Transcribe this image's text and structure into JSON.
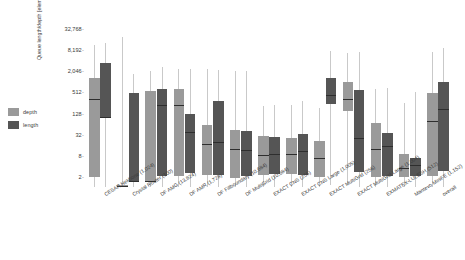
{
  "legend": {
    "items": [
      {
        "label": "depth",
        "color": "#9a9a9a",
        "name": "depth"
      },
      {
        "label": "length",
        "color": "#555555",
        "name": "length"
      }
    ]
  },
  "axes": {
    "ylabel": "Queue length/depth [elements]",
    "yticks": [
      "32,768",
      "8,192",
      "2,046",
      "512",
      "128",
      "32",
      "8",
      "2"
    ],
    "ytick_values": [
      32768,
      8192,
      2046,
      512,
      128,
      32,
      8,
      2
    ],
    "ylim": [
      1,
      65536
    ],
    "yscale": "log4",
    "grid": false
  },
  "colors": {
    "depth": "#9a9a9a",
    "length": "#555555",
    "whisker": "#c9c9c9",
    "median": "#2e2e2e",
    "text": "#3a3a3a",
    "background": "#ffffff"
  },
  "chart_data": {
    "type": "bar",
    "subtype": "box-plot",
    "title": "",
    "xlabel": "",
    "ylabel": "Queue length/depth [elements]",
    "ylim": [
      1,
      65536
    ],
    "yscale": "log4",
    "grid": false,
    "legend_position": "left",
    "categories": [
      "CESAR Nekbone (1,024)",
      "Crystal Router (100)",
      "DF AMG (13,824)",
      "DF AMR (1,728)",
      "DF Fillboundary (10,684)",
      "DF MultiGrid (10,684)",
      "EXACT CNS (256)",
      "EXACT CNS Large (1,005)",
      "EXACT MultiGrid (256)",
      "EXACT MultiGrid Large (1,004)",
      "EXMATEX-LULESH (512)",
      "Mantevo MiniFE (1,152)",
      "overall"
    ],
    "series": [
      {
        "name": "depth",
        "color": "#9a9a9a",
        "boxes": [
          {
            "whisker_low": 1.1,
            "q1": 2.1,
            "median": 330,
            "q3": 1350,
            "whisker_high": 11000
          },
          {
            "whisker_low": 1.1,
            "q1": 1.15,
            "median": 1.15,
            "q3": 1.2,
            "whisker_high": 19000
          },
          {
            "whisker_low": 1.1,
            "q1": 1.6,
            "median": 1.6,
            "q3": 560,
            "whisker_high": 2100
          },
          {
            "whisker_low": 1.1,
            "q1": 2.2,
            "median": 230,
            "q3": 620,
            "whisker_high": 2400
          },
          {
            "whisker_low": 1.1,
            "q1": 2.3,
            "median": 18,
            "q3": 62,
            "whisker_high": 2300
          },
          {
            "whisker_low": 1.1,
            "q1": 1.9,
            "median": 13,
            "q3": 45,
            "whisker_high": 2100
          },
          {
            "whisker_low": 1.1,
            "q1": 2.4,
            "median": 8.5,
            "q3": 30,
            "whisker_high": 210
          },
          {
            "whisker_low": 1.1,
            "q1": 2.5,
            "median": 9,
            "q3": 26,
            "whisker_high": 220
          },
          {
            "whisker_low": 1.1,
            "q1": 2.0,
            "median": 7,
            "q3": 22,
            "whisker_high": 190
          },
          {
            "whisker_low": 1.3,
            "q1": 150,
            "median": 330,
            "q3": 1000,
            "whisker_high": 6800
          },
          {
            "whisker_low": 1.1,
            "q1": 2.0,
            "median": 13,
            "q3": 70,
            "whisker_high": 640
          },
          {
            "whisker_low": 1.1,
            "q1": 2.0,
            "median": 3.6,
            "q3": 9,
            "whisker_high": 260
          },
          {
            "whisker_low": 1.1,
            "q1": 2.2,
            "median": 80,
            "q3": 480,
            "whisker_high": 7000
          }
        ]
      },
      {
        "name": "length",
        "color": "#555555",
        "boxes": [
          {
            "whisker_low": 1.1,
            "q1": 105,
            "median": 105,
            "q3": 3400,
            "whisker_high": 13000
          },
          {
            "whisker_low": 1.1,
            "q1": 1.6,
            "median": 1.6,
            "q3": 500,
            "whisker_high": 1700
          },
          {
            "whisker_low": 1.1,
            "q1": 2.2,
            "median": 230,
            "q3": 620,
            "whisker_high": 2600
          },
          {
            "whisker_low": 1.1,
            "q1": 2.6,
            "median": 38,
            "q3": 125,
            "whisker_high": 2400
          },
          {
            "whisker_low": 1.1,
            "q1": 2.4,
            "median": 20,
            "q3": 290,
            "whisker_high": 2200
          },
          {
            "whisker_low": 1.1,
            "q1": 2.2,
            "median": 12,
            "q3": 42,
            "whisker_high": 2000
          },
          {
            "whisker_low": 1.1,
            "q1": 2.5,
            "median": 9,
            "q3": 28,
            "whisker_high": 230
          },
          {
            "whisker_low": 1.1,
            "q1": 2.3,
            "median": 11,
            "q3": 33,
            "whisker_high": 300
          },
          {
            "whisker_low": 1.2,
            "q1": 240,
            "median": 430,
            "q3": 1350,
            "whisker_high": 7400
          },
          {
            "whisker_low": 1.1,
            "q1": 2.8,
            "median": 26,
            "q3": 600,
            "whisker_high": 7000
          },
          {
            "whisker_low": 1.1,
            "q1": 2.2,
            "median": 16,
            "q3": 36,
            "whisker_high": 700
          },
          {
            "whisker_low": 1.1,
            "q1": 2.2,
            "median": 4.5,
            "q3": 7,
            "whisker_high": 520
          },
          {
            "whisker_low": 1.1,
            "q1": 3.0,
            "median": 170,
            "q3": 1000,
            "whisker_high": 9500
          }
        ]
      }
    ]
  }
}
